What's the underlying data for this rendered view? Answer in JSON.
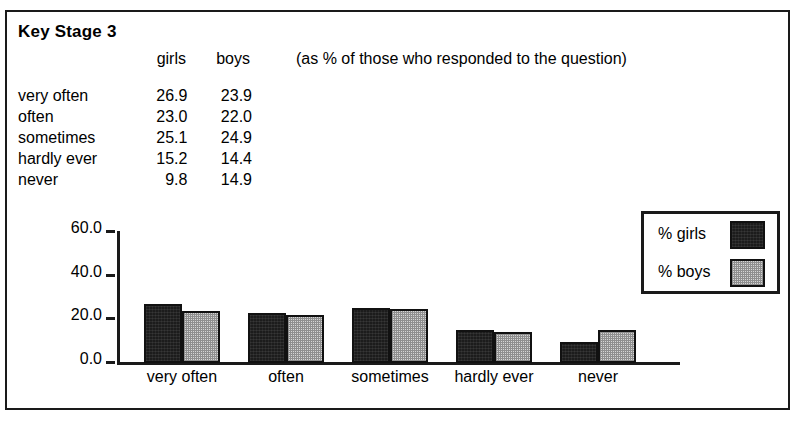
{
  "figure": {
    "title": "Key Stage 3",
    "note": "(as % of those who responded to the question)"
  },
  "table": {
    "columns": [
      "",
      "girls",
      "boys"
    ],
    "rows": [
      {
        "label": "very often",
        "girls": "26.9",
        "boys": "23.9"
      },
      {
        "label": "often",
        "girls": "23.0",
        "boys": "22.0"
      },
      {
        "label": "sometimes",
        "girls": "25.1",
        "boys": "24.9"
      },
      {
        "label": "hardly ever",
        "girls": "15.2",
        "boys": "14.4"
      },
      {
        "label": "never",
        "girls": "9.8",
        "boys": "14.9"
      }
    ]
  },
  "legend": {
    "items": [
      {
        "label": "% girls",
        "swatch": "dark-solid"
      },
      {
        "label": "% boys",
        "swatch": "light-stipple"
      }
    ]
  },
  "axis": {
    "y_ticks": [
      "60.0",
      "40.0",
      "20.0",
      "0.0"
    ]
  },
  "colors": {
    "girls_fill": "#1c1c1c",
    "boys_fill": "#d6d6d6",
    "outline": "#111111",
    "frame": "#1a1a1a",
    "background": "#ffffff"
  },
  "chart_data": {
    "type": "bar",
    "title": "Key Stage 3",
    "subtitle": "(as % of those who responded to the question)",
    "xlabel": "",
    "ylabel": "",
    "categories": [
      "very often",
      "often",
      "sometimes",
      "hardly ever",
      "never"
    ],
    "series": [
      {
        "name": "% girls",
        "values": [
          26.9,
          23.0,
          25.1,
          15.2,
          9.8
        ]
      },
      {
        "name": "% boys",
        "values": [
          23.9,
          22.0,
          24.9,
          14.4,
          14.9
        ]
      }
    ],
    "ylim": [
      0,
      60
    ],
    "yticks": [
      0,
      20,
      40,
      60
    ],
    "grid": false,
    "legend_position": "top-right"
  }
}
